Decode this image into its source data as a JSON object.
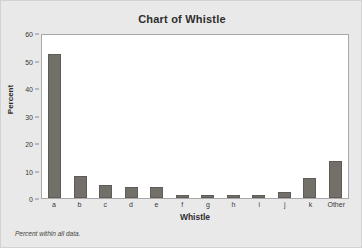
{
  "chart_data": {
    "type": "bar",
    "title": "Chart of Whistle",
    "xlabel": "Whistle",
    "ylabel": "Percent",
    "categories": [
      "a",
      "b",
      "c",
      "d",
      "e",
      "f",
      "g",
      "h",
      "i",
      "j",
      "k",
      "Other"
    ],
    "values": [
      52.2,
      8.1,
      4.8,
      4.0,
      4.0,
      1.2,
      1.2,
      1.2,
      1.1,
      2.1,
      7.1,
      13.5
    ],
    "ylim": [
      0,
      60
    ],
    "yticks": [
      0,
      10,
      20,
      30,
      40,
      50,
      60
    ],
    "ytick_labels": [
      "0",
      "10",
      "20",
      "30",
      "40",
      "50",
      "60"
    ],
    "grid": false,
    "legend": null,
    "footnote": "Percent within all data.",
    "bar_color": "#73706a",
    "plot_background": "#ffffff",
    "figure_background": "#e9e9e9"
  }
}
